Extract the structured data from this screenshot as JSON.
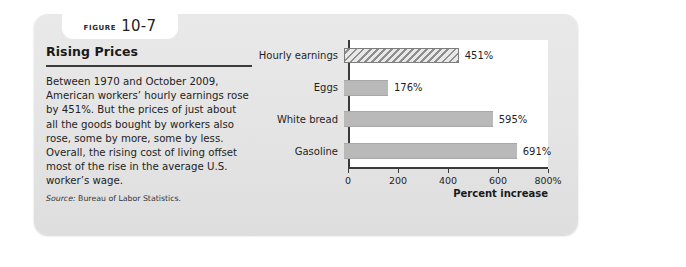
{
  "figure": {
    "tab_word": "FIGURE",
    "tab_number": "10-7"
  },
  "panel": {
    "title": "Rising Prices",
    "body": "Between 1970 and October 2009, American workers’ hourly earnings rose by 451%. But the prices of just about all the goods bought by workers also rose, some by more, some by less. Overall, the rising cost of living offset most of the rise in the average U.S. worker’s wage.",
    "source_label": "Source:",
    "source_text": "Bureau of Labor Statistics."
  },
  "chart_data": {
    "type": "bar",
    "orientation": "horizontal",
    "title": "",
    "categories": [
      "Hourly earnings",
      "Eggs",
      "White bread",
      "Gasoline"
    ],
    "values": [
      451,
      176,
      595,
      691
    ],
    "value_labels": [
      "451%",
      "176%",
      "595%",
      "691%"
    ],
    "xlabel": "Percent increase",
    "ylabel": "",
    "xlim": [
      0,
      800
    ],
    "xticks": [
      0,
      200,
      400,
      600,
      800
    ],
    "xtick_labels": [
      "0",
      "200",
      "400",
      "600",
      "800%"
    ],
    "grid": false,
    "legend": "none",
    "series_styles": [
      "hatched",
      "solid",
      "solid",
      "solid"
    ],
    "colors": {
      "bar_fill": "#b9b9b9",
      "hatch_line": "#8e8e8e",
      "axis": "#3a3a3a",
      "panel_background": "#ffffff",
      "card_background": "#e6e6e6"
    }
  }
}
